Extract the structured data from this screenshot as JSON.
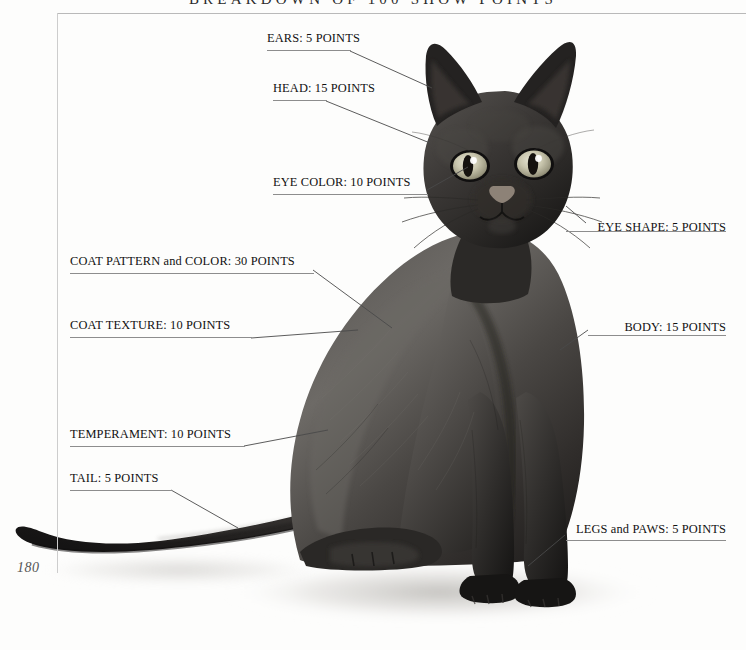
{
  "page": {
    "running_head": "BREAKDOWN OF 100 SHOW POINTS",
    "folio": "180",
    "background": "#fdfdfc",
    "rule_color": "#b9b9b9"
  },
  "callouts": [
    {
      "id": "ears",
      "label": "EARS: 5 POINTS",
      "points": 5,
      "side": "left"
    },
    {
      "id": "head",
      "label": "HEAD: 15 POINTS",
      "points": 15,
      "side": "left"
    },
    {
      "id": "eye-color",
      "label": "EYE COLOR: 10 POINTS",
      "points": 10,
      "side": "left"
    },
    {
      "id": "eye-shape",
      "label": "EYE SHAPE: 5 POINTS",
      "points": 5,
      "side": "right"
    },
    {
      "id": "coat-pattern",
      "label": "COAT PATTERN and COLOR: 30 POINTS",
      "points": 30,
      "side": "left"
    },
    {
      "id": "coat-texture",
      "label": "COAT TEXTURE: 10 POINTS",
      "points": 10,
      "side": "left"
    },
    {
      "id": "body",
      "label": "BODY: 15 POINTS",
      "points": 15,
      "side": "right"
    },
    {
      "id": "temperament",
      "label": "TEMPERAMENT: 10 POINTS",
      "points": 10,
      "side": "left"
    },
    {
      "id": "tail",
      "label": "TAIL: 5 POINTS",
      "points": 5,
      "side": "left"
    },
    {
      "id": "legs-paws",
      "label": "LEGS and PAWS: 5 POINTS",
      "points": 5,
      "side": "right"
    }
  ]
}
